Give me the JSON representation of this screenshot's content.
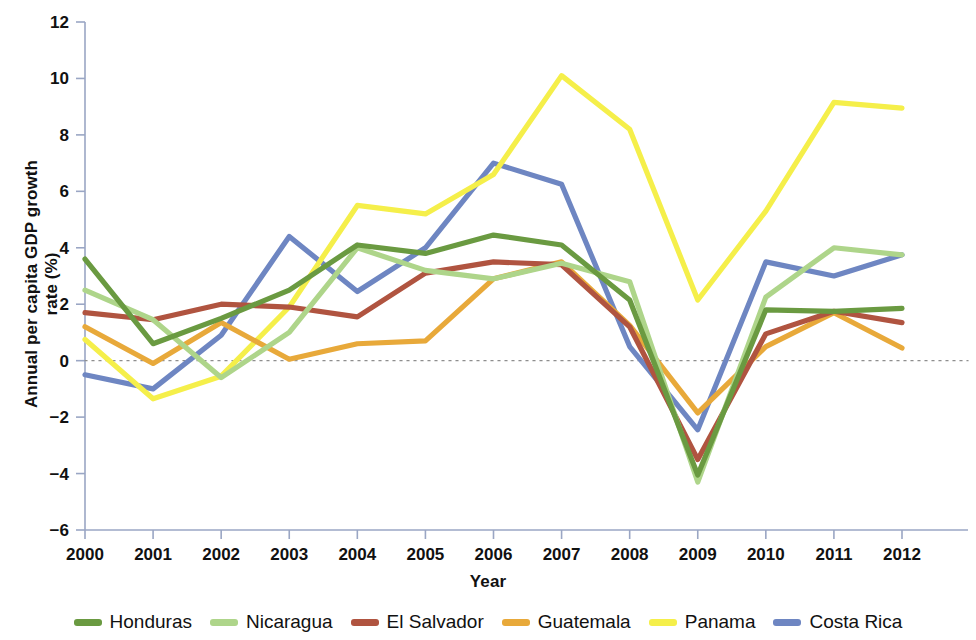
{
  "chart_data": {
    "type": "line",
    "title": "",
    "xlabel": "Year",
    "ylabel": "Annual per capita GDP growth rate (%)",
    "categories": [
      2000,
      2001,
      2002,
      2003,
      2004,
      2005,
      2006,
      2007,
      2008,
      2009,
      2010,
      2011,
      2012
    ],
    "xlim": [
      2000,
      2012
    ],
    "ylim": [
      -6,
      12
    ],
    "yticks": [
      -6,
      -4,
      -2,
      0,
      2,
      4,
      6,
      8,
      10,
      12
    ],
    "ytick_labels": [
      "−6",
      "−4",
      "−2",
      "0",
      "2",
      "4",
      "6",
      "8",
      "10",
      "12"
    ],
    "xticks": [
      2000,
      2001,
      2002,
      2003,
      2004,
      2005,
      2006,
      2007,
      2008,
      2009,
      2010,
      2011,
      2012
    ],
    "xtick_labels": [
      "2000",
      "2001",
      "2002",
      "2003",
      "2004",
      "2005",
      "2006",
      "2007",
      "2008",
      "2009",
      "2010",
      "2011",
      "2012"
    ],
    "grid": false,
    "zero_line": true,
    "zero_line_style": "dotted",
    "legend_position": "bottom",
    "series": [
      {
        "name": "Honduras",
        "color": "#6a9a41",
        "values": [
          3.6,
          0.6,
          1.5,
          2.5,
          4.1,
          3.8,
          4.45,
          4.1,
          2.15,
          -4.05,
          1.8,
          1.75,
          1.85
        ]
      },
      {
        "name": "Nicaragua",
        "color": "#aed58a",
        "values": [
          2.5,
          1.45,
          -0.6,
          1.0,
          4.0,
          3.2,
          2.9,
          3.45,
          2.8,
          -4.3,
          2.25,
          4.0,
          3.75
        ]
      },
      {
        "name": "El Salvador",
        "color": "#b05440",
        "values": [
          1.7,
          1.45,
          2.0,
          1.9,
          1.55,
          3.1,
          3.5,
          3.4,
          1.2,
          -3.5,
          0.95,
          1.75,
          1.35
        ]
      },
      {
        "name": "Guatemala",
        "color": "#e8a93a",
        "values": [
          1.2,
          -0.1,
          1.35,
          0.05,
          0.6,
          0.7,
          2.9,
          3.5,
          1.25,
          -1.85,
          0.5,
          1.7,
          0.45
        ]
      },
      {
        "name": "Panama",
        "color": "#f5ef4a",
        "values": [
          0.75,
          -1.35,
          -0.55,
          1.9,
          5.5,
          5.2,
          6.6,
          10.1,
          8.2,
          2.15,
          5.3,
          9.15,
          8.95
        ]
      },
      {
        "name": "Costa Rica",
        "color": "#6e86c2",
        "values": [
          -0.5,
          -1.0,
          0.9,
          4.4,
          2.45,
          4.0,
          7.0,
          6.25,
          0.5,
          -2.45,
          3.5,
          3.0,
          3.75
        ]
      }
    ]
  },
  "legend": {
    "items": [
      {
        "label": "Honduras",
        "color": "#6a9a41"
      },
      {
        "label": "Nicaragua",
        "color": "#aed58a"
      },
      {
        "label": "El Salvador",
        "color": "#b05440"
      },
      {
        "label": "Guatemala",
        "color": "#e8a93a"
      },
      {
        "label": "Panama",
        "color": "#f5ef4a"
      },
      {
        "label": "Costa Rica",
        "color": "#6e86c2"
      }
    ]
  },
  "axes": {
    "x_title": "Year",
    "y_title": "Annual per capita GDP growth rate (%)"
  }
}
